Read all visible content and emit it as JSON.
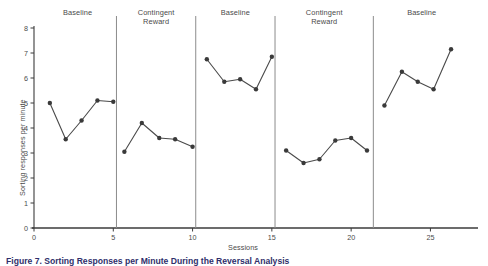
{
  "chart_data": {
    "type": "line",
    "title": "",
    "xlabel": "Sessions",
    "ylabel": "Sorting responses per minute",
    "xlim": [
      0,
      28
    ],
    "ylim": [
      0,
      8
    ],
    "xticks": [
      0,
      5,
      10,
      15,
      20,
      25
    ],
    "yticks": [
      0,
      1,
      2,
      3,
      4,
      5,
      6,
      7,
      8
    ],
    "grid": false,
    "legend": "none",
    "marker": "filled-circle",
    "line_color": "#4a4a4a",
    "marker_color": "#3a3a3a",
    "phase_divider_color": "#8c8c8c",
    "phases": [
      {
        "label": "Baseline",
        "start": 0.3,
        "end": 5.2
      },
      {
        "label": "Contingent\nReward",
        "start": 5.2,
        "end": 10.2
      },
      {
        "label": "Baseline",
        "start": 10.2,
        "end": 15.2
      },
      {
        "label": "Contingent\nReward",
        "start": 15.2,
        "end": 21.4
      },
      {
        "label": "Baseline",
        "start": 21.4,
        "end": 27.5
      }
    ],
    "series": [
      {
        "name": "Baseline 1",
        "x": [
          1,
          2,
          3,
          4,
          5
        ],
        "values": [
          5.0,
          3.55,
          4.3,
          5.1,
          5.05
        ]
      },
      {
        "name": "Contingent Reward 1",
        "x": [
          5.7,
          6.8,
          7.9,
          8.9,
          10.0
        ],
        "values": [
          3.05,
          4.2,
          3.6,
          3.55,
          3.25
        ]
      },
      {
        "name": "Baseline 2",
        "x": [
          10.9,
          12.0,
          13.0,
          14.0,
          15.0
        ],
        "values": [
          6.75,
          5.85,
          5.95,
          5.55,
          6.85
        ]
      },
      {
        "name": "Contingent Reward 2",
        "x": [
          15.9,
          17.0,
          18.0,
          19.0,
          20.0,
          21.0
        ],
        "values": [
          3.1,
          2.6,
          2.75,
          3.5,
          3.6,
          3.1
        ]
      },
      {
        "name": "Baseline 3",
        "x": [
          22.1,
          23.2,
          24.2,
          25.2,
          26.3
        ],
        "values": [
          4.9,
          6.25,
          5.85,
          5.55,
          7.15
        ]
      }
    ]
  },
  "figure": {
    "caption": "Figure 7. Sorting Responses per Minute During the Reversal Analysis"
  }
}
